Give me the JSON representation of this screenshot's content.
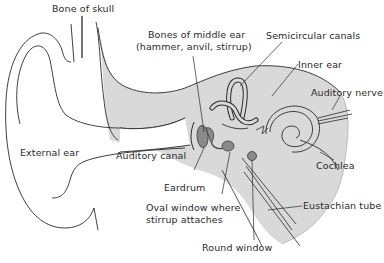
{
  "diagram": {
    "colors": {
      "background": "#ffffff",
      "tissue_fill": "#d9d9d9",
      "ossicle_fill": "#8a8a8a",
      "line": "#2a2a2a"
    },
    "labels": {
      "bone_of_skull": "Bone of skull",
      "bones_middle_ear_line1": "Bones of middle ear",
      "bones_middle_ear_line2": "(hammer, anvil, stirrup)",
      "semicircular_canals": "Semicircular canals",
      "inner_ear": "Inner ear",
      "auditory_nerve": "Auditory nerve",
      "external_ear": "External ear",
      "auditory_canal": "Auditory canal",
      "cochlea": "Cochlea",
      "eardrum": "Eardrum",
      "oval_window_line1": "Oval window where",
      "oval_window_line2": "stirrup attaches",
      "eustachian_tube": "Eustachian tube",
      "round_window": "Round window"
    }
  }
}
